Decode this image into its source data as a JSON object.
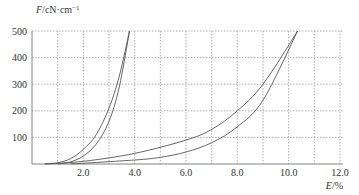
{
  "chart_data": {
    "type": "line",
    "title": "",
    "xlabel": "E/%",
    "ylabel": "F/cN·cm⁻¹",
    "xlabel_var": "E",
    "xlabel_unit": "/%",
    "ylabel_var": "F",
    "ylabel_unit": "/cN·cm",
    "ylabel_sup": "−1",
    "xlim": [
      0,
      12
    ],
    "ylim": [
      0,
      500
    ],
    "x_ticks": [
      2,
      4,
      6,
      8,
      10,
      12
    ],
    "x_tick_labels": [
      "2.0",
      "4.0",
      "6.0",
      "8.0",
      "10.0",
      "12.0"
    ],
    "y_ticks": [
      100,
      200,
      300,
      400,
      500
    ],
    "y_tick_labels": [
      "100",
      "200",
      "300",
      "400",
      "500"
    ],
    "grid": true,
    "x_grid_step": 1,
    "y_grid_step": 100,
    "legend": null,
    "series": [
      {
        "name": "loop-1-loading",
        "x": [
          0.5,
          1.0,
          1.5,
          2.0,
          2.5,
          3.0,
          3.4,
          3.8
        ],
        "y": [
          0,
          5,
          20,
          55,
          110,
          210,
          330,
          500
        ]
      },
      {
        "name": "loop-1-unloading",
        "x": [
          1.0,
          1.5,
          2.0,
          2.5,
          3.0,
          3.4,
          3.8
        ],
        "y": [
          0,
          8,
          30,
          75,
          160,
          290,
          500
        ]
      },
      {
        "name": "loop-2-loading",
        "x": [
          0.5,
          2.0,
          4.0,
          6.0,
          7.0,
          8.0,
          9.0,
          10.35
        ],
        "y": [
          0,
          10,
          40,
          90,
          130,
          200,
          300,
          500
        ]
      },
      {
        "name": "loop-2-unloading",
        "x": [
          1.5,
          4.0,
          5.0,
          6.0,
          7.0,
          8.0,
          9.0,
          10.35
        ],
        "y": [
          0,
          15,
          25,
          45,
          80,
          140,
          240,
          500
        ]
      }
    ]
  },
  "colors": {
    "curve": "#555555",
    "grid": "#9a9a9a",
    "text": "#333333"
  }
}
